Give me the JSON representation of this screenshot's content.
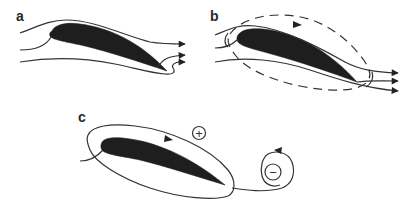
{
  "figure": {
    "panels": [
      {
        "id": "a",
        "label": "a",
        "description": "Airfoil with streamlines; flow wraps around sharp trailing edge"
      },
      {
        "id": "b",
        "label": "b",
        "description": "Airfoil with streamlines and dashed circulation contour"
      },
      {
        "id": "c",
        "label": "c",
        "description": "Bound circulation around airfoil and shed starting vortex"
      }
    ],
    "symbols": {
      "bound_circulation_sign": "+",
      "starting_vortex_sign": "−"
    },
    "colors": {
      "ink": "#333333",
      "airfoil_fill": "#1e1e1e",
      "background": "#ffffff"
    }
  }
}
